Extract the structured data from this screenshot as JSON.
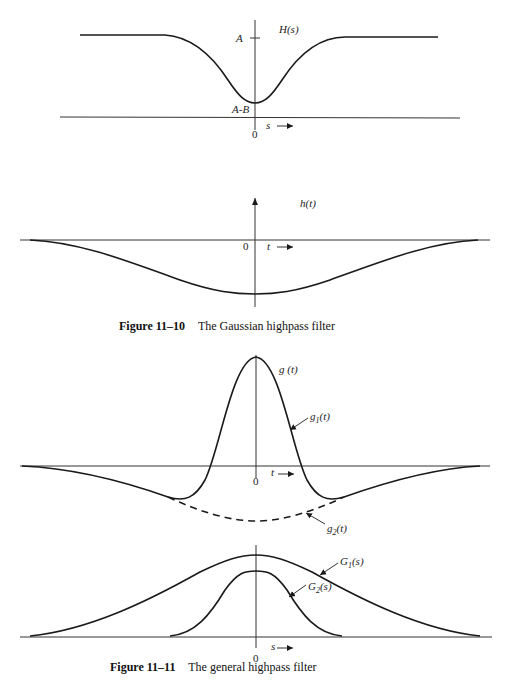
{
  "figure_11_10": {
    "caption_number": "Figure 11–10",
    "caption_text": "The Gaussian highpass filter",
    "top_panel": {
      "curve_label": "H(s)",
      "level_high": "A",
      "level_low": "A-B",
      "origin": "0",
      "axis_var": "s"
    },
    "bottom_panel": {
      "curve_label": "h(t)",
      "origin": "0",
      "axis_var": "t"
    }
  },
  "figure_11_11": {
    "caption_number": "Figure 11–11",
    "caption_text": "The general highpass filter",
    "top_panel": {
      "curve_label": "g (t)",
      "g1_label": "g",
      "g1_sub": "1",
      "g2_label": "g",
      "g2_sub": "2",
      "fn_arg": "(t)",
      "origin": "0",
      "axis_var": "t"
    },
    "bottom_panel": {
      "G1_label": "G",
      "G1_sub": "1",
      "G2_label": "G",
      "G2_sub": "2",
      "fn_arg": "(s)",
      "origin": "0",
      "axis_var": "s"
    }
  }
}
